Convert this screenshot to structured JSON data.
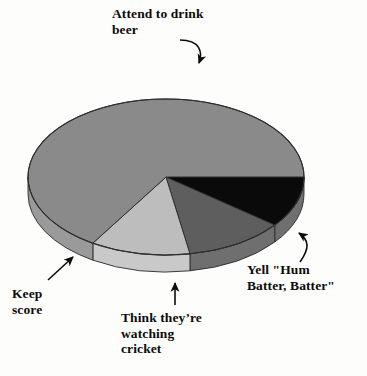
{
  "figure": {
    "type": "pie-chart-3d",
    "background_color": "#fdfdfc",
    "center": {
      "x": 166,
      "y": 177
    },
    "radius_x": 138,
    "radius_y": 78,
    "depth": 17
  },
  "labels": {
    "beer": "Attend to drink\nbeer",
    "keep_score": "Keep\nscore",
    "cricket": "Think they’re\nwatching\ncricket",
    "yell": "Yell \"Hum\nBatter, Batter\""
  },
  "chart_data": {
    "type": "pie",
    "title": "",
    "legend_position": "callout-labels",
    "grid": false,
    "categories": [
      "Attend to drink beer",
      "Yell \"Hum Batter, Batter\"",
      "Think they’re watching cricket",
      "Keep score"
    ],
    "values": [
      66,
      11,
      12,
      11
    ],
    "unit": "percent",
    "colors": [
      "#8a8a8a",
      "#0a0a0a",
      "#5e5e5e",
      "#bdbdbd"
    ],
    "side_colors": [
      "#9a9a9a",
      "#6f6f6f",
      "#6f6f6f",
      "#c9c9c9"
    ],
    "start_angle_deg": 0,
    "direction": "clockwise",
    "slices": [
      {
        "label": "Yell \"Hum Batter, Batter\"",
        "value": 11,
        "start_deg": 0,
        "end_deg": 38,
        "color": "#0a0a0a"
      },
      {
        "label": "Think they’re watching cricket",
        "value": 12,
        "start_deg": 38,
        "end_deg": 80,
        "color": "#5e5e5e"
      },
      {
        "label": "Keep score",
        "value": 11,
        "start_deg": 80,
        "end_deg": 122,
        "color": "#bdbdbd"
      },
      {
        "label": "Attend to drink beer",
        "value": 66,
        "start_deg": 122,
        "end_deg": 360,
        "color": "#8a8a8a"
      }
    ],
    "annotations": [
      {
        "text": "Attend to drink beer",
        "target": "Attend to drink beer",
        "arrow": "curved-down-right"
      },
      {
        "text": "Keep score",
        "target": "Keep score",
        "arrow": "diagonal-up-right"
      },
      {
        "text": "Think they’re watching cricket",
        "target": "Think they’re watching cricket",
        "arrow": "vertical-up"
      },
      {
        "text": "Yell \"Hum Batter, Batter\"",
        "target": "Yell \"Hum Batter, Batter\"",
        "arrow": "curved-up-left"
      }
    ]
  }
}
